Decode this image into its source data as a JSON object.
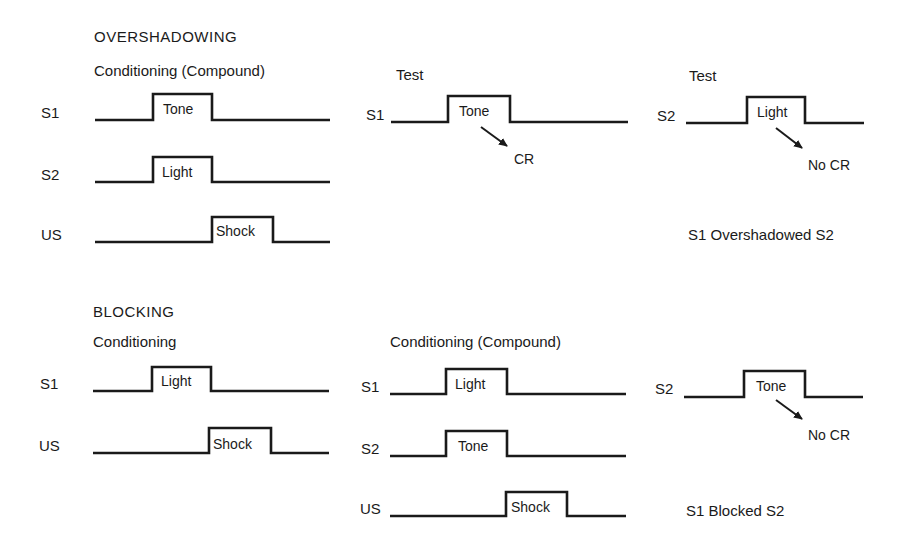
{
  "overshadowing": {
    "title": "OVERSHADOWING",
    "conditioning": {
      "heading": "Conditioning (Compound)",
      "rows": [
        {
          "label": "S1",
          "pulse": "Tone"
        },
        {
          "label": "S2",
          "pulse": "Light"
        },
        {
          "label": "US",
          "pulse": "Shock"
        }
      ]
    },
    "test1": {
      "heading": "Test",
      "label": "S1",
      "pulse": "Tone",
      "response": "CR"
    },
    "test2": {
      "heading": "Test",
      "label": "S2",
      "pulse": "Light",
      "response": "No CR"
    },
    "conclusion": "S1 Overshadowed S2"
  },
  "blocking": {
    "title": "BLOCKING",
    "conditioning": {
      "heading": "Conditioning",
      "rows": [
        {
          "label": "S1",
          "pulse": "Light"
        },
        {
          "label": "US",
          "pulse": "Shock"
        }
      ]
    },
    "compound": {
      "heading": "Conditioning (Compound)",
      "rows": [
        {
          "label": "S1",
          "pulse": "Light"
        },
        {
          "label": "S2",
          "pulse": "Tone"
        },
        {
          "label": "US",
          "pulse": "Shock"
        }
      ]
    },
    "test": {
      "label": "S2",
      "pulse": "Tone",
      "response": "No CR"
    },
    "conclusion": "S1 Blocked S2"
  },
  "colors": {
    "ink": "#1a1a1a",
    "background": "#ffffff"
  }
}
